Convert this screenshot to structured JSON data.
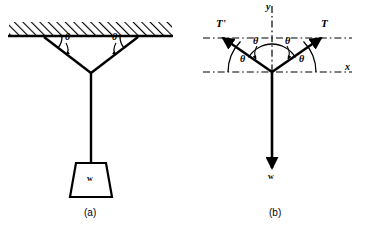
{
  "figure": {
    "captions": {
      "left": "(a)",
      "right": "(b)"
    }
  },
  "panel_a": {
    "name": "hanging weight on two cables from ceiling",
    "ceiling": {
      "label": "hatched ceiling",
      "hatch_direction": "up-right"
    },
    "angles": [
      {
        "label": "θ",
        "position": "left-cable-at-ceiling"
      },
      {
        "label": "θ",
        "position": "right-cable-at-ceiling"
      }
    ],
    "weight_block": {
      "label": "w",
      "shape": "trapezoid"
    }
  },
  "panel_b": {
    "name": "free-body diagram at cable junction",
    "axes": {
      "x_label": "x",
      "y_label": "y"
    },
    "vectors": [
      {
        "label": "T'",
        "direction": "up-left",
        "kind": "tension"
      },
      {
        "label": "T",
        "direction": "up-right",
        "kind": "tension"
      },
      {
        "label": "w",
        "direction": "down",
        "kind": "weight"
      }
    ],
    "angles": [
      {
        "label": "θ",
        "position": "upper-left-from-vertical"
      },
      {
        "label": "θ",
        "position": "upper-right-from-vertical"
      },
      {
        "label": "θ",
        "position": "lower-left-from-horizontal"
      },
      {
        "label": "θ",
        "position": "lower-right-from-horizontal"
      }
    ]
  },
  "colors": {
    "ink": "#000000",
    "background": "#ffffff"
  }
}
